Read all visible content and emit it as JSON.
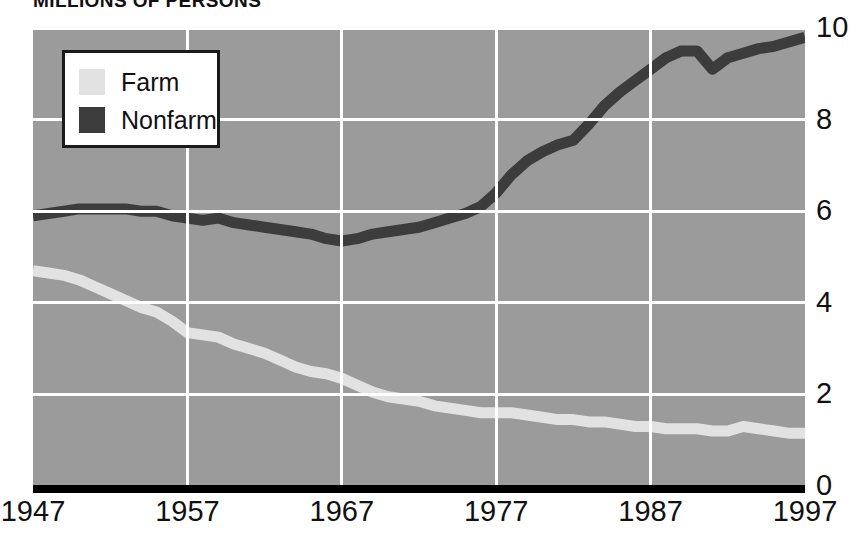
{
  "chart_data": {
    "type": "line",
    "title": "MILLIONS OF PERSONS",
    "xlabel": "",
    "ylabel": "",
    "xlim": [
      1947,
      1997
    ],
    "ylim": [
      0,
      10
    ],
    "xticks": [
      "1947",
      "1957",
      "1967",
      "1977",
      "1987",
      "1997"
    ],
    "xtick_values": [
      1947,
      1957,
      1967,
      1977,
      1987,
      1997
    ],
    "yticks": [
      "0",
      "2",
      "4",
      "6",
      "8",
      "10"
    ],
    "ytick_values": [
      0,
      2,
      4,
      6,
      8,
      10
    ],
    "grid": true,
    "legend_position": "top-left",
    "plot_background": "#9b9b9b",
    "gridline_color": "#ffffff",
    "baseline_color": "#000000",
    "series": [
      {
        "name": "Farm",
        "color": "#e2e2e2",
        "x": [
          1947,
          1948,
          1949,
          1950,
          1951,
          1952,
          1953,
          1954,
          1955,
          1956,
          1957,
          1958,
          1959,
          1960,
          1961,
          1962,
          1963,
          1964,
          1965,
          1966,
          1967,
          1968,
          1969,
          1970,
          1971,
          1972,
          1973,
          1974,
          1975,
          1976,
          1977,
          1978,
          1979,
          1980,
          1981,
          1982,
          1983,
          1984,
          1985,
          1986,
          1987,
          1988,
          1989,
          1990,
          1991,
          1992,
          1993,
          1994,
          1995,
          1996,
          1997
        ],
        "values": [
          4.7,
          4.65,
          4.6,
          4.5,
          4.35,
          4.2,
          4.05,
          3.9,
          3.8,
          3.6,
          3.35,
          3.3,
          3.25,
          3.1,
          3.0,
          2.9,
          2.75,
          2.6,
          2.5,
          2.45,
          2.35,
          2.2,
          2.05,
          1.95,
          1.9,
          1.85,
          1.75,
          1.7,
          1.65,
          1.6,
          1.6,
          1.6,
          1.55,
          1.5,
          1.45,
          1.45,
          1.4,
          1.4,
          1.35,
          1.3,
          1.3,
          1.25,
          1.25,
          1.25,
          1.2,
          1.2,
          1.3,
          1.25,
          1.2,
          1.15,
          1.15
        ]
      },
      {
        "name": "Nonfarm",
        "color": "#3c3c3c",
        "x": [
          1947,
          1948,
          1949,
          1950,
          1951,
          1952,
          1953,
          1954,
          1955,
          1956,
          1957,
          1958,
          1959,
          1960,
          1961,
          1962,
          1963,
          1964,
          1965,
          1966,
          1967,
          1968,
          1969,
          1970,
          1971,
          1972,
          1973,
          1974,
          1975,
          1976,
          1977,
          1978,
          1979,
          1980,
          1981,
          1982,
          1983,
          1984,
          1985,
          1986,
          1987,
          1988,
          1989,
          1990,
          1991,
          1992,
          1993,
          1994,
          1995,
          1996,
          1997
        ],
        "values": [
          5.9,
          5.95,
          6.0,
          6.05,
          6.05,
          6.05,
          6.05,
          6.0,
          6.0,
          5.9,
          5.85,
          5.8,
          5.85,
          5.75,
          5.7,
          5.65,
          5.6,
          5.55,
          5.5,
          5.4,
          5.35,
          5.4,
          5.5,
          5.55,
          5.6,
          5.65,
          5.75,
          5.85,
          5.95,
          6.1,
          6.4,
          6.8,
          7.1,
          7.3,
          7.45,
          7.55,
          7.9,
          8.3,
          8.6,
          8.85,
          9.1,
          9.35,
          9.5,
          9.5,
          9.1,
          9.35,
          9.45,
          9.55,
          9.6,
          9.7,
          9.8
        ]
      }
    ]
  },
  "legend": {
    "items": [
      {
        "label": "Farm",
        "color": "#e2e2e2"
      },
      {
        "label": "Nonfarm",
        "color": "#3c3c3c"
      }
    ]
  }
}
